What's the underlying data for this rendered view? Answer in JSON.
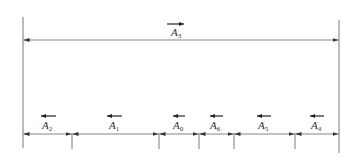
{
  "diagram": {
    "type": "dimension-chain",
    "colors": {
      "line": "#555555",
      "text": "#333333",
      "background": "#ffffff"
    },
    "overall": {
      "label": "A",
      "subscript": "3",
      "vector_direction": "right",
      "x_start": 23,
      "x_end": 339,
      "y": 40
    },
    "extension_lines": [
      23,
      72,
      159,
      199,
      234,
      295,
      339
    ],
    "segments": [
      {
        "label": "A",
        "subscript": "2",
        "vector_direction": "left",
        "x_start": 23,
        "x_end": 72
      },
      {
        "label": "A",
        "subscript": "1",
        "vector_direction": "left",
        "x_start": 72,
        "x_end": 159
      },
      {
        "label": "A",
        "subscript": "0",
        "vector_direction": "left",
        "x_start": 159,
        "x_end": 199
      },
      {
        "label": "A",
        "subscript": "6",
        "vector_direction": "left",
        "x_start": 199,
        "x_end": 234
      },
      {
        "label": "A",
        "subscript": "5",
        "vector_direction": "left",
        "x_start": 234,
        "x_end": 295
      },
      {
        "label": "A",
        "subscript": "4",
        "vector_direction": "left",
        "x_start": 295,
        "x_end": 339
      }
    ]
  }
}
